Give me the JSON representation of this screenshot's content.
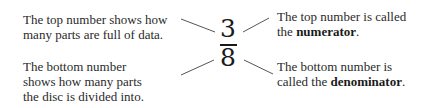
{
  "fraction": {
    "numerator": "3",
    "denominator": "8"
  },
  "annotations": {
    "top_left": {
      "line1": "The top number shows how",
      "line2": "many parts are full of data."
    },
    "top_right": {
      "line1": "The top number is called",
      "line2_prefix": "the ",
      "line2_bold": "numerator",
      "line2_suffix": "."
    },
    "bottom_left": {
      "line1": "The bottom number",
      "line2": "shows how many parts",
      "line3": "the disc is divided into."
    },
    "bottom_right": {
      "line1": "The bottom number is",
      "line2_prefix": "called the ",
      "line2_bold": "denominator",
      "line2_suffix": "."
    }
  },
  "colors": {
    "text": "#2a2a2a",
    "lines": "#555555",
    "background": "#ffffff"
  }
}
